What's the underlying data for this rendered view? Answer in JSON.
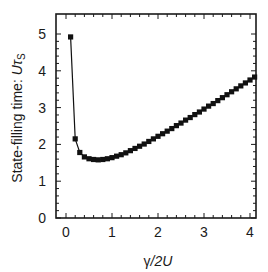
{
  "chart_data": {
    "type": "line",
    "title": "",
    "xlabel": "γ/2U",
    "ylabel": "State-filling time: Uτs",
    "ylabel_parts": {
      "prefix": "State-filling time: ",
      "var": "U",
      "sym": "τ",
      "sub": "S"
    },
    "xlabel_parts": {
      "gamma": "γ",
      "rest": "/2",
      "var": "U"
    },
    "xlim": [
      -0.15,
      4.15
    ],
    "ylim": [
      0,
      5.3
    ],
    "xticks": [
      0,
      1,
      2,
      3,
      4
    ],
    "yticks": [
      0,
      1,
      2,
      3,
      4,
      5
    ],
    "grid": false,
    "legend": null,
    "marker": "square",
    "series": [
      {
        "name": "State-filling time",
        "x": [
          0.1,
          0.2,
          0.3,
          0.4,
          0.5,
          0.6,
          0.7,
          0.8,
          0.9,
          1.0,
          1.1,
          1.2,
          1.3,
          1.4,
          1.5,
          1.6,
          1.7,
          1.8,
          1.9,
          2.0,
          2.1,
          2.2,
          2.3,
          2.4,
          2.5,
          2.6,
          2.7,
          2.8,
          2.9,
          3.0,
          3.1,
          3.2,
          3.3,
          3.4,
          3.5,
          3.6,
          3.7,
          3.8,
          3.9,
          4.0,
          4.1
        ],
        "y": [
          4.92,
          2.15,
          1.78,
          1.66,
          1.61,
          1.59,
          1.58,
          1.59,
          1.61,
          1.64,
          1.68,
          1.72,
          1.77,
          1.83,
          1.89,
          1.95,
          2.01,
          2.08,
          2.15,
          2.22,
          2.29,
          2.36,
          2.43,
          2.51,
          2.58,
          2.66,
          2.73,
          2.81,
          2.88,
          2.96,
          3.04,
          3.11,
          3.19,
          3.27,
          3.35,
          3.43,
          3.51,
          3.59,
          3.67,
          3.75,
          3.83
        ]
      }
    ]
  },
  "colors": {
    "line": "#111111",
    "axis": "#1a1a1a"
  }
}
